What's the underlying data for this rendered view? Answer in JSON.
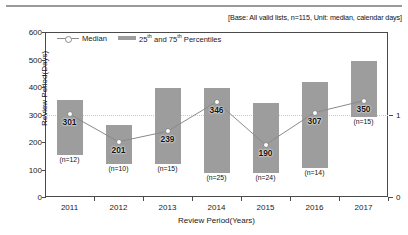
{
  "base_note": "[Base: All valid lists, n=115, Unit: median, calendar days]",
  "legend": {
    "median_label": "Median",
    "percentile_label_pre": "25",
    "percentile_label_sup1": "th",
    "percentile_label_mid": " and 75",
    "percentile_label_sup2": "th",
    "percentile_label_post": " Percentiles"
  },
  "axes": {
    "ylabel": "Review Period(Days)",
    "xlabel": "Review Period(Years)",
    "yticks": [
      "600",
      "500",
      "400",
      "300",
      "200",
      "100",
      "0"
    ],
    "right_ticks": [
      "1",
      "0"
    ]
  },
  "chart_data": {
    "type": "bar",
    "title": "",
    "subtitle": "[Base: All valid lists, n=115, Unit: median, calendar days]",
    "xlabel": "Review Period(Years)",
    "ylabel": "Review Period(Days)",
    "ylim": [
      0,
      600
    ],
    "ytick_step": 100,
    "grid": true,
    "legend_position": "top-left-inside",
    "categories": [
      "2011",
      "2012",
      "2013",
      "2014",
      "2015",
      "2016",
      "2017"
    ],
    "series": [
      {
        "name": "Median",
        "type": "line",
        "values": [
          301,
          201,
          239,
          346,
          190,
          307,
          350
        ]
      },
      {
        "name": "25th and 75th Percentiles",
        "type": "bar-range",
        "p25": [
          151,
          121,
          121,
          88,
          88,
          107,
          291
        ],
        "p75": [
          353,
          261,
          397,
          397,
          342,
          420,
          493
        ]
      }
    ],
    "counts": [
      "(n=12)",
      "(n=10)",
      "(n=15)",
      "(n=25)",
      "(n=24)",
      "(n=14)",
      "(n=15)"
    ],
    "value_labels": [
      "301",
      "201",
      "239",
      "346",
      "190",
      "307",
      "350"
    ],
    "colors": {
      "bar": "#9d9d9d",
      "line": "#8a8a8a",
      "marker_fill": "#ffffff",
      "axis": "#4a4a4a",
      "grid": "#c9c9c9"
    },
    "right_axis": {
      "ticks": [
        1,
        0
      ],
      "gridline_at": 1
    }
  }
}
